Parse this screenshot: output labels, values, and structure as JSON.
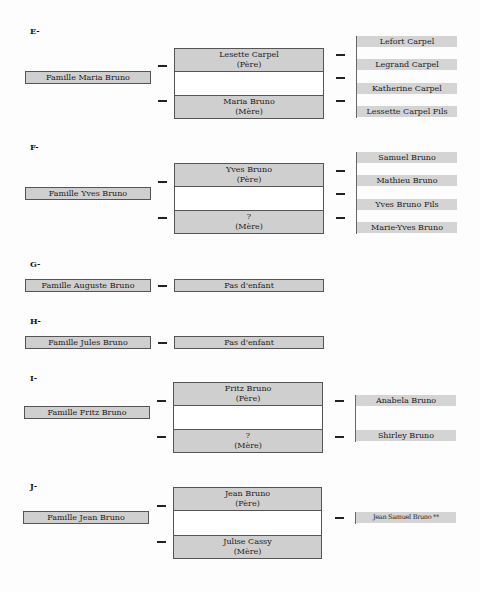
{
  "sections": [
    {
      "label": "E-",
      "family": "Famille Maria Bruno",
      "father": {
        "name": "Lesette Carpel",
        "role": "(Père)"
      },
      "mother": {
        "name": "Maria Bruno",
        "role": "(Mère)"
      },
      "children": [
        "Lefort Carpel",
        "Legrand Carpel",
        "Katherine Carpel",
        "Lessette Carpel Fils"
      ]
    },
    {
      "label": "F-",
      "family": "Famille Yves Bruno",
      "father": {
        "name": "Yves Bruno",
        "role": "(Père)"
      },
      "mother": {
        "name": "?",
        "role": "(Mère)"
      },
      "children": [
        "Samuel Bruno",
        "Mathieu Bruno",
        "Yves Bruno Fils",
        "Marie-Yves Bruno"
      ]
    },
    {
      "label": "G-",
      "family": "Famille Auguste Bruno",
      "note": "Pas d'enfant"
    },
    {
      "label": "H-",
      "family": "Famille Jules Bruno",
      "note": "Pas d'enfant"
    },
    {
      "label": "I-",
      "family": "Famille Fritz Bruno",
      "father": {
        "name": "Fritz Bruno",
        "role": "(Père)"
      },
      "mother": {
        "name": "?",
        "role": "(Mère)"
      },
      "children": [
        "Anabela Bruno",
        "Shirley Bruno"
      ]
    },
    {
      "label": "J-",
      "family": "Famille Jean Bruno",
      "father": {
        "name": "Jean Bruno",
        "role": "(Père)"
      },
      "mother": {
        "name": "Julise Cassy",
        "role": "(Mère)"
      },
      "children": [
        "Jean Samuel Bruno **"
      ]
    }
  ],
  "colors": {
    "box_fill": "#cfcfcf",
    "border": "#555555",
    "background": "#fdfdfd"
  }
}
